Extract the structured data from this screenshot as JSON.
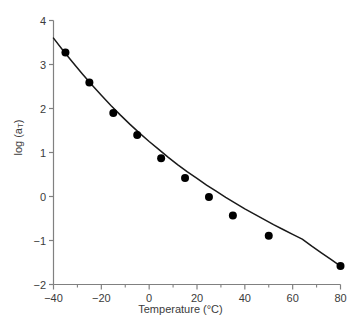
{
  "chart_data": {
    "type": "line",
    "title": "",
    "xlabel": "Temperature (°C)",
    "ylabel_text": "log (a",
    "ylabel_sub": "T",
    "ylabel_tail": ")",
    "xlim": [
      -40,
      80
    ],
    "ylim": [
      -2,
      4
    ],
    "xticks": [
      -40,
      -20,
      0,
      20,
      40,
      60,
      80
    ],
    "xticklabels": [
      "−40",
      "−20",
      "0",
      "20",
      "40",
      "60",
      "80"
    ],
    "xminorticks": [
      -30,
      -10,
      10,
      30,
      50,
      70
    ],
    "yticks": [
      -2,
      -1,
      0,
      1,
      2,
      3,
      4
    ],
    "yticklabels": [
      "−2",
      "−1",
      "0",
      "1",
      "2",
      "3",
      "4"
    ],
    "grid": false,
    "legend": null,
    "marker": "filled-circle",
    "marker_color": "#000000",
    "line_color": "#1a1a1a",
    "axis_color": "#808080",
    "series": [
      {
        "name": "log (aT) vs Temperature",
        "x": [
          -35,
          -25,
          -15,
          -5,
          5,
          15,
          25,
          35,
          50,
          80
        ],
        "y": [
          3.27,
          2.59,
          1.9,
          1.4,
          0.87,
          0.42,
          -0.01,
          -0.43,
          -0.89,
          -1.58
        ]
      }
    ],
    "fit_curve": {
      "name": "WLF fit",
      "x": [
        -40,
        -36,
        -32,
        -28,
        -24,
        -20,
        -16,
        -12,
        -8,
        -4,
        0,
        4,
        8,
        12,
        16,
        20,
        24,
        28,
        32,
        36,
        40,
        44,
        48,
        52,
        56,
        60,
        64,
        68,
        72,
        76,
        80
      ],
      "y": [
        3.6,
        3.32,
        3.05,
        2.79,
        2.54,
        2.3,
        2.07,
        1.85,
        1.64,
        1.44,
        1.25,
        1.07,
        0.89,
        0.72,
        0.56,
        0.41,
        0.26,
        0.12,
        -0.02,
        -0.15,
        -0.28,
        -0.4,
        -0.52,
        -0.64,
        -0.75,
        -0.86,
        -0.97,
        -1.13,
        -1.28,
        -1.43,
        -1.58
      ]
    }
  }
}
